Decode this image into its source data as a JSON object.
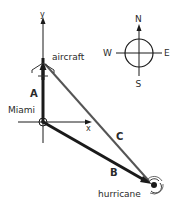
{
  "diagram": {
    "axes": {
      "x_label": "x",
      "y_label": "y"
    },
    "points": {
      "aircraft": "aircraft",
      "origin": "Miami",
      "hurricane": "hurricane"
    },
    "vectors": [
      {
        "name": "A",
        "from": "Miami",
        "to": "aircraft"
      },
      {
        "name": "B",
        "from": "Miami",
        "to": "hurricane"
      },
      {
        "name": "C",
        "from": "aircraft",
        "to": "hurricane"
      }
    ],
    "compass": {
      "north": "N",
      "south": "S",
      "east": "E",
      "west": "W"
    },
    "colors": {
      "ink": "#1a1a1a",
      "vector_c": "#555555",
      "text": "#2a2a2a"
    }
  }
}
